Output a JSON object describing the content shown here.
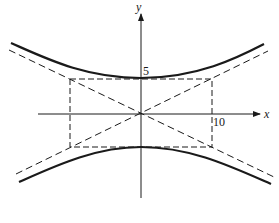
{
  "diagram": {
    "type": "hyperbola",
    "equation_hint": "y^2/25 - x^2/100 = 1",
    "axes": {
      "x_label": "x",
      "y_label": "y"
    },
    "tick_labels": {
      "y_tick": "5",
      "x_tick": "10"
    },
    "elements": [
      "upper hyperbola branch (solid)",
      "lower hyperbola branch (solid)",
      "two asymptotes (dashed)",
      "fundamental rectangle (dashed)"
    ],
    "colors": {
      "ink": "#1a1a1a",
      "background": "#ffffff"
    }
  }
}
